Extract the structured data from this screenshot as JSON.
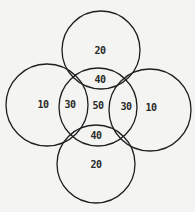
{
  "diagram": {
    "type": "five-circle-venn",
    "background": "#f4f4f2",
    "stroke_color": "#1e1e1e",
    "circles": [
      {
        "name": "top",
        "cx": 101,
        "cy": 50,
        "r": 39
      },
      {
        "name": "left",
        "cx": 47,
        "cy": 105,
        "r": 41
      },
      {
        "name": "center",
        "cx": 98,
        "cy": 107,
        "r": 39
      },
      {
        "name": "right",
        "cx": 150,
        "cy": 110,
        "r": 41
      },
      {
        "name": "bottom",
        "cx": 96,
        "cy": 164,
        "r": 39
      }
    ],
    "labels": {
      "top_only": "20",
      "top_center": "40",
      "left_only": "10",
      "left_center": "30",
      "center_only": "50",
      "right_center": "30",
      "right_only": "10",
      "bottom_center": "40",
      "bottom_only": "20"
    }
  }
}
